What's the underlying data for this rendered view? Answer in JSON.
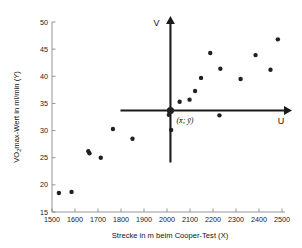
{
  "chart_data": {
    "type": "scatter",
    "title": "",
    "xlabel": "Strecke in m beim Cooper-Test (X)",
    "ylabel": "VO2max-Wert in ml/min (Y)",
    "ylabel_display": "VO₂max-Wert in ml/min (Y)",
    "xlim": [
      1500,
      2500
    ],
    "ylim": [
      15,
      50
    ],
    "xticks": [
      1500,
      1600,
      1700,
      1800,
      1900,
      2000,
      2100,
      2200,
      2300,
      2400,
      2500
    ],
    "yticks": [
      15,
      20,
      25,
      30,
      35,
      40,
      45,
      50
    ],
    "xtick_labels": [
      "1500",
      "1600",
      "1700",
      "1800",
      "1900",
      "2000",
      "2100",
      "2200",
      "2300",
      "2400",
      "2500"
    ],
    "ytick_labels": [
      "15",
      "20",
      "25",
      "30",
      "35",
      "40",
      "45",
      "50"
    ],
    "grid": false,
    "legend": null,
    "points": [
      {
        "x": 1530,
        "y": 18.5
      },
      {
        "x": 1585,
        "y": 18.7
      },
      {
        "x": 1658,
        "y": 26.2
      },
      {
        "x": 1663,
        "y": 25.8
      },
      {
        "x": 1712,
        "y": 25.0
      },
      {
        "x": 1765,
        "y": 30.3
      },
      {
        "x": 1850,
        "y": 28.5
      },
      {
        "x": 2008,
        "y": 32.9
      },
      {
        "x": 2018,
        "y": 30.1
      },
      {
        "x": 2055,
        "y": 35.3
      },
      {
        "x": 2098,
        "y": 35.7
      },
      {
        "x": 2122,
        "y": 37.3
      },
      {
        "x": 2148,
        "y": 39.7
      },
      {
        "x": 2188,
        "y": 44.3
      },
      {
        "x": 2228,
        "y": 32.8
      },
      {
        "x": 2232,
        "y": 41.4
      },
      {
        "x": 2320,
        "y": 39.5
      },
      {
        "x": 2385,
        "y": 43.9
      },
      {
        "x": 2450,
        "y": 41.2
      },
      {
        "x": 2482,
        "y": 46.8
      }
    ],
    "centroid": {
      "x": 2015,
      "y": 33.7,
      "label": "(x̄; ȳ)"
    },
    "annotations": [
      {
        "name": "v-axis-label",
        "text": "V"
      },
      {
        "name": "u-axis-label",
        "text": "U"
      }
    ],
    "uv_axes": {
      "vertical_label": "V",
      "horizontal_label": "U",
      "origin_x": 2015,
      "origin_y": 33.7
    },
    "colors": {
      "point": "#231f20",
      "frame": "#8a8a8a",
      "uv_axis": "#1a1a1a",
      "text": "#111111",
      "background": "#ffffff"
    }
  }
}
